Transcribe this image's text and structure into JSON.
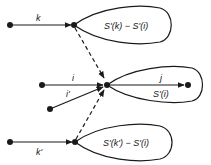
{
  "diagram": {
    "top": {
      "edge_label": "k",
      "loop_label": "S'(k) − S'(i)"
    },
    "middle": {
      "edge_label_i": "i",
      "edge_label_iprime": "i'",
      "loop_edge_label": "j",
      "loop_label": "S'(i)"
    },
    "bottom": {
      "edge_label": "k'",
      "loop_label": "S'(k') − S'(i)"
    },
    "colors": {
      "stroke": "#1a1a1a",
      "background": "#ffffff"
    }
  }
}
